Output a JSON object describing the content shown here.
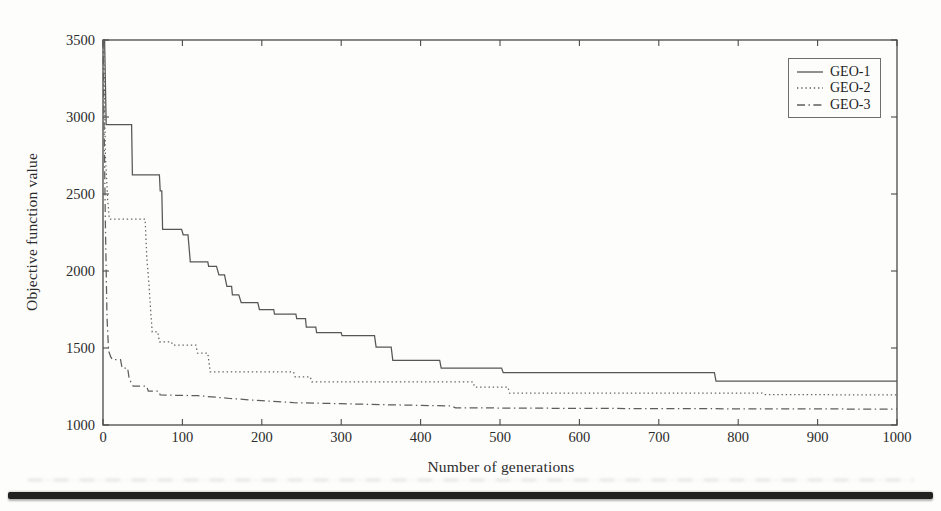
{
  "figure": {
    "paper_color": "#fdfdfc",
    "axis_color": "#4a4a4a",
    "text_color": "#2b2b2b",
    "separator_color": "#212121"
  },
  "chart_data": {
    "type": "line",
    "title": "",
    "xlabel": "Number of generations",
    "ylabel": "Objective function value",
    "xlim": [
      0,
      1000
    ],
    "ylim": [
      1000,
      3500
    ],
    "x_ticks": [
      0,
      100,
      200,
      300,
      400,
      500,
      600,
      700,
      800,
      900,
      1000
    ],
    "y_ticks": [
      1000,
      1500,
      2000,
      2500,
      3000,
      3500
    ],
    "grid": false,
    "legend_position": "upper right",
    "legend_entries": [
      "GEO-1",
      "GEO-2",
      "GEO-3"
    ],
    "series": [
      {
        "name": "GEO-1",
        "style": "solid",
        "color": "#565656",
        "points": [
          [
            0,
            3500
          ],
          [
            2,
            3500
          ],
          [
            4,
            2950
          ],
          [
            36,
            2950
          ],
          [
            37,
            2625
          ],
          [
            71,
            2625
          ],
          [
            72,
            2520
          ],
          [
            74,
            2520
          ],
          [
            75,
            2270
          ],
          [
            99,
            2270
          ],
          [
            101,
            2235
          ],
          [
            107,
            2235
          ],
          [
            110,
            2060
          ],
          [
            132,
            2060
          ],
          [
            133,
            2030
          ],
          [
            143,
            2030
          ],
          [
            146,
            1975
          ],
          [
            153,
            1975
          ],
          [
            156,
            1900
          ],
          [
            162,
            1900
          ],
          [
            163,
            1845
          ],
          [
            171,
            1845
          ],
          [
            174,
            1795
          ],
          [
            195,
            1795
          ],
          [
            197,
            1750
          ],
          [
            215,
            1750
          ],
          [
            216,
            1720
          ],
          [
            243,
            1720
          ],
          [
            244,
            1690
          ],
          [
            255,
            1690
          ],
          [
            256,
            1635
          ],
          [
            268,
            1635
          ],
          [
            269,
            1600
          ],
          [
            300,
            1600
          ],
          [
            301,
            1580
          ],
          [
            342,
            1580
          ],
          [
            344,
            1505
          ],
          [
            363,
            1505
          ],
          [
            365,
            1420
          ],
          [
            424,
            1420
          ],
          [
            426,
            1370
          ],
          [
            502,
            1370
          ],
          [
            504,
            1340
          ],
          [
            770,
            1340
          ],
          [
            772,
            1285
          ],
          [
            1000,
            1285
          ]
        ]
      },
      {
        "name": "GEO-2",
        "style": "dotted",
        "color": "#636363",
        "points": [
          [
            0,
            3500
          ],
          [
            1,
            3500
          ],
          [
            3,
            2750
          ],
          [
            6,
            2450
          ],
          [
            8,
            2337
          ],
          [
            53,
            2337
          ],
          [
            55,
            2100
          ],
          [
            58,
            1900
          ],
          [
            60,
            1750
          ],
          [
            62,
            1605
          ],
          [
            69,
            1605
          ],
          [
            71,
            1540
          ],
          [
            86,
            1540
          ],
          [
            88,
            1518
          ],
          [
            117,
            1518
          ],
          [
            119,
            1467
          ],
          [
            132,
            1467
          ],
          [
            135,
            1345
          ],
          [
            240,
            1345
          ],
          [
            242,
            1313
          ],
          [
            261,
            1313
          ],
          [
            263,
            1280
          ],
          [
            466,
            1280
          ],
          [
            468,
            1247
          ],
          [
            510,
            1247
          ],
          [
            512,
            1207
          ],
          [
            830,
            1207
          ],
          [
            833,
            1197
          ],
          [
            1000,
            1196
          ]
        ]
      },
      {
        "name": "GEO-3",
        "style": "dashdot",
        "color": "#5d5d5d",
        "points": [
          [
            0,
            3500
          ],
          [
            1,
            3100
          ],
          [
            3,
            2300
          ],
          [
            5,
            1700
          ],
          [
            7,
            1480
          ],
          [
            10,
            1440
          ],
          [
            12,
            1425
          ],
          [
            22,
            1425
          ],
          [
            24,
            1370
          ],
          [
            31,
            1370
          ],
          [
            33,
            1300
          ],
          [
            38,
            1252
          ],
          [
            55,
            1252
          ],
          [
            57,
            1220
          ],
          [
            70,
            1220
          ],
          [
            72,
            1195
          ],
          [
            120,
            1190
          ],
          [
            160,
            1172
          ],
          [
            200,
            1158
          ],
          [
            240,
            1145
          ],
          [
            300,
            1138
          ],
          [
            360,
            1131
          ],
          [
            438,
            1124
          ],
          [
            444,
            1112
          ],
          [
            600,
            1108
          ],
          [
            800,
            1105
          ],
          [
            1000,
            1103
          ]
        ]
      }
    ]
  }
}
